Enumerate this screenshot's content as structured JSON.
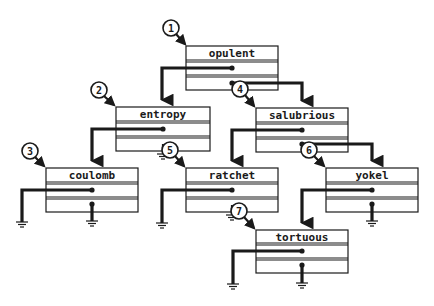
{
  "diagram": {
    "colors": {
      "ink": "#1a1a1a",
      "background": "#ffffff"
    },
    "nodes": [
      {
        "id": "opulent",
        "label": "opulent",
        "number": "1",
        "x": 186,
        "y": 46,
        "w": 92,
        "h": 44,
        "left": "entropy",
        "right": "salubrious"
      },
      {
        "id": "entropy",
        "label": "entropy",
        "number": "2",
        "x": 116,
        "y": 107,
        "w": 94,
        "h": 44,
        "left": "coulomb",
        "right": null
      },
      {
        "id": "coulomb",
        "label": "coulomb",
        "number": "3",
        "x": 46,
        "y": 168,
        "w": 92,
        "h": 44,
        "left": null,
        "right": null
      },
      {
        "id": "salubrious",
        "label": "salubrious",
        "number": "4",
        "x": 256,
        "y": 108,
        "w": 92,
        "h": 44,
        "left": "ratchet",
        "right": "yokel"
      },
      {
        "id": "ratchet",
        "label": "ratchet",
        "number": "5",
        "x": 186,
        "y": 168,
        "w": 92,
        "h": 44,
        "left": null,
        "right": "tortuous"
      },
      {
        "id": "yokel",
        "label": "yokel",
        "number": "6",
        "x": 326,
        "y": 168,
        "w": 92,
        "h": 44,
        "left": "tortuous",
        "right": null
      },
      {
        "id": "tortuous",
        "label": "tortuous",
        "number": "7",
        "x": 256,
        "y": 230,
        "w": 92,
        "h": 44,
        "left": null,
        "right": null
      }
    ],
    "markers": [
      {
        "number": "1",
        "cx": 171,
        "cy": 28
      },
      {
        "number": "2",
        "cx": 99,
        "cy": 90
      },
      {
        "number": "3",
        "cx": 30,
        "cy": 151
      },
      {
        "number": "4",
        "cx": 240,
        "cy": 89
      },
      {
        "number": "5",
        "cx": 170,
        "cy": 150
      },
      {
        "number": "6",
        "cx": 309,
        "cy": 150
      },
      {
        "number": "7",
        "cx": 239,
        "cy": 211
      }
    ]
  }
}
